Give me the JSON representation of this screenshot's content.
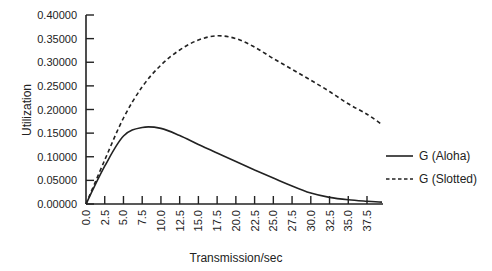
{
  "chart_data": {
    "type": "line",
    "title": "",
    "xlabel": "Transmission/sec",
    "ylabel": "Utilization",
    "xlim": [
      0,
      39.5
    ],
    "ylim": [
      0,
      0.4
    ],
    "grid": false,
    "legend_position": "right",
    "x_ticks": [
      "0.0",
      "2.5",
      "5.0",
      "7.5",
      "10.0",
      "12.5",
      "15.0",
      "17.5",
      "20.0",
      "22.5",
      "25.0",
      "27.5",
      "30.0",
      "32.5",
      "35.0",
      "37.5"
    ],
    "y_ticks": [
      "0.00000",
      "0.05000",
      "0.10000",
      "0.15000",
      "0.20000",
      "0.25000",
      "0.30000",
      "0.35000",
      "0.40000"
    ],
    "x": [
      0,
      2.5,
      5,
      7.5,
      10,
      12.5,
      15,
      17.5,
      20,
      22.5,
      25,
      27.5,
      30,
      32.5,
      35,
      37.5,
      39.5
    ],
    "series": [
      {
        "name": "G (Aloha)",
        "style": "solid",
        "color": "#222222",
        "values": [
          0,
          0.08,
          0.144,
          0.162,
          0.16,
          0.145,
          0.126,
          0.108,
          0.09,
          0.072,
          0.055,
          0.038,
          0.023,
          0.014,
          0.009,
          0.006,
          0.004
        ]
      },
      {
        "name": "G (Slotted)",
        "style": "dashed",
        "color": "#222222",
        "values": [
          0,
          0.093,
          0.182,
          0.248,
          0.294,
          0.326,
          0.347,
          0.356,
          0.35,
          0.332,
          0.308,
          0.285,
          0.262,
          0.238,
          0.212,
          0.19,
          0.168
        ]
      }
    ]
  }
}
